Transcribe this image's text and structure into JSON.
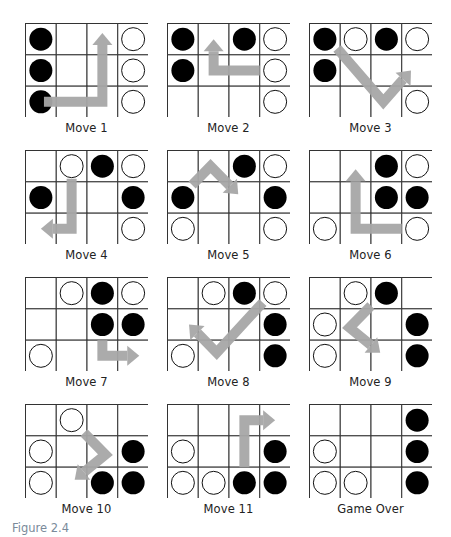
{
  "figure": {
    "label": "Figure 2.4",
    "grid": {
      "columns": 4,
      "rows": 3
    },
    "colors": {
      "black_piece": "#000000",
      "white_piece": "#ffffff",
      "arrow": "#a6a6a6",
      "grid_line": "#333333",
      "label": "#7a8a9a"
    }
  },
  "panels": [
    {
      "caption": "Move 1",
      "pieces": [
        {
          "r": 0,
          "c": 0,
          "p": "B"
        },
        {
          "r": 1,
          "c": 0,
          "p": "B"
        },
        {
          "r": 2,
          "c": 0,
          "p": "B"
        },
        {
          "r": 0,
          "c": 3,
          "p": "W"
        },
        {
          "r": 1,
          "c": 3,
          "p": "W"
        },
        {
          "r": 2,
          "c": 3,
          "p": "W"
        }
      ],
      "arrow": {
        "path": [
          [
            0.6,
            2.5
          ],
          [
            2.5,
            2.5
          ],
          [
            2.5,
            0.3
          ]
        ]
      }
    },
    {
      "caption": "Move 2",
      "pieces": [
        {
          "r": 0,
          "c": 0,
          "p": "B"
        },
        {
          "r": 0,
          "c": 2,
          "p": "B"
        },
        {
          "r": 1,
          "c": 0,
          "p": "B"
        },
        {
          "r": 0,
          "c": 3,
          "p": "W"
        },
        {
          "r": 1,
          "c": 3,
          "p": "W"
        },
        {
          "r": 2,
          "c": 3,
          "p": "W"
        }
      ],
      "arrow": {
        "path": [
          [
            3.0,
            1.5
          ],
          [
            1.5,
            1.5
          ],
          [
            1.5,
            0.5
          ]
        ]
      }
    },
    {
      "caption": "Move 3",
      "pieces": [
        {
          "r": 0,
          "c": 0,
          "p": "B"
        },
        {
          "r": 0,
          "c": 2,
          "p": "B"
        },
        {
          "r": 1,
          "c": 0,
          "p": "B"
        },
        {
          "r": 0,
          "c": 1,
          "p": "W"
        },
        {
          "r": 0,
          "c": 3,
          "p": "W"
        },
        {
          "r": 2,
          "c": 3,
          "p": "W"
        }
      ],
      "arrow": {
        "path": [
          [
            0.9,
            0.8
          ],
          [
            2.4,
            2.5
          ],
          [
            3.3,
            1.5
          ]
        ]
      }
    },
    {
      "caption": "Move 4",
      "pieces": [
        {
          "r": 0,
          "c": 2,
          "p": "B"
        },
        {
          "r": 1,
          "c": 0,
          "p": "B"
        },
        {
          "r": 1,
          "c": 3,
          "p": "B"
        },
        {
          "r": 0,
          "c": 1,
          "p": "W"
        },
        {
          "r": 0,
          "c": 3,
          "p": "W"
        },
        {
          "r": 2,
          "c": 3,
          "p": "W"
        }
      ],
      "arrow": {
        "path": [
          [
            1.5,
            0.9
          ],
          [
            1.5,
            2.5
          ],
          [
            0.5,
            2.5
          ]
        ]
      }
    },
    {
      "caption": "Move 5",
      "pieces": [
        {
          "r": 0,
          "c": 2,
          "p": "B"
        },
        {
          "r": 1,
          "c": 0,
          "p": "B"
        },
        {
          "r": 1,
          "c": 3,
          "p": "B"
        },
        {
          "r": 0,
          "c": 3,
          "p": "W"
        },
        {
          "r": 2,
          "c": 0,
          "p": "W"
        },
        {
          "r": 2,
          "c": 3,
          "p": "W"
        }
      ],
      "arrow": {
        "path": [
          [
            0.8,
            1.1
          ],
          [
            1.4,
            0.5
          ],
          [
            2.3,
            1.4
          ]
        ]
      }
    },
    {
      "caption": "Move 6",
      "pieces": [
        {
          "r": 0,
          "c": 2,
          "p": "B"
        },
        {
          "r": 1,
          "c": 2,
          "p": "B"
        },
        {
          "r": 1,
          "c": 3,
          "p": "B"
        },
        {
          "r": 0,
          "c": 3,
          "p": "W"
        },
        {
          "r": 2,
          "c": 0,
          "p": "W"
        },
        {
          "r": 2,
          "c": 3,
          "p": "W"
        }
      ],
      "arrow": {
        "path": [
          [
            3.0,
            2.5
          ],
          [
            1.5,
            2.5
          ],
          [
            1.5,
            0.6
          ]
        ]
      }
    },
    {
      "caption": "Move 7",
      "pieces": [
        {
          "r": 0,
          "c": 2,
          "p": "B"
        },
        {
          "r": 1,
          "c": 2,
          "p": "B"
        },
        {
          "r": 1,
          "c": 3,
          "p": "B"
        },
        {
          "r": 0,
          "c": 1,
          "p": "W"
        },
        {
          "r": 0,
          "c": 3,
          "p": "W"
        },
        {
          "r": 2,
          "c": 0,
          "p": "W"
        }
      ],
      "arrow": {
        "path": [
          [
            2.5,
            2.0
          ],
          [
            2.5,
            2.5
          ],
          [
            3.7,
            2.5
          ]
        ]
      }
    },
    {
      "caption": "Move 8",
      "pieces": [
        {
          "r": 0,
          "c": 2,
          "p": "B"
        },
        {
          "r": 1,
          "c": 3,
          "p": "B"
        },
        {
          "r": 2,
          "c": 3,
          "p": "B"
        },
        {
          "r": 0,
          "c": 1,
          "p": "W"
        },
        {
          "r": 0,
          "c": 3,
          "p": "W"
        },
        {
          "r": 2,
          "c": 0,
          "p": "W"
        }
      ],
      "arrow": {
        "path": [
          [
            3.1,
            0.8
          ],
          [
            1.6,
            2.4
          ],
          [
            0.7,
            1.5
          ]
        ]
      }
    },
    {
      "caption": "Move 9",
      "pieces": [
        {
          "r": 0,
          "c": 2,
          "p": "B"
        },
        {
          "r": 1,
          "c": 3,
          "p": "B"
        },
        {
          "r": 2,
          "c": 3,
          "p": "B"
        },
        {
          "r": 0,
          "c": 1,
          "p": "W"
        },
        {
          "r": 1,
          "c": 0,
          "p": "W"
        },
        {
          "r": 2,
          "c": 0,
          "p": "W"
        }
      ],
      "arrow": {
        "path": [
          [
            2.0,
            0.9
          ],
          [
            1.3,
            1.6
          ],
          [
            2.3,
            2.4
          ]
        ]
      }
    },
    {
      "caption": "Move 10",
      "pieces": [
        {
          "r": 1,
          "c": 3,
          "p": "B"
        },
        {
          "r": 2,
          "c": 2,
          "p": "B"
        },
        {
          "r": 2,
          "c": 3,
          "p": "B"
        },
        {
          "r": 0,
          "c": 1,
          "p": "W"
        },
        {
          "r": 1,
          "c": 0,
          "p": "W"
        },
        {
          "r": 2,
          "c": 0,
          "p": "W"
        }
      ],
      "arrow": {
        "path": [
          [
            1.9,
            0.9
          ],
          [
            2.6,
            1.6
          ],
          [
            1.6,
            2.4
          ]
        ]
      }
    },
    {
      "caption": "Move 11",
      "pieces": [
        {
          "r": 1,
          "c": 3,
          "p": "B"
        },
        {
          "r": 2,
          "c": 2,
          "p": "B"
        },
        {
          "r": 2,
          "c": 3,
          "p": "B"
        },
        {
          "r": 1,
          "c": 0,
          "p": "W"
        },
        {
          "r": 2,
          "c": 0,
          "p": "W"
        },
        {
          "r": 2,
          "c": 1,
          "p": "W"
        }
      ],
      "arrow": {
        "path": [
          [
            2.5,
            2.0
          ],
          [
            2.5,
            0.5
          ],
          [
            3.5,
            0.5
          ]
        ]
      }
    },
    {
      "caption": "Game Over",
      "pieces": [
        {
          "r": 0,
          "c": 3,
          "p": "B"
        },
        {
          "r": 1,
          "c": 3,
          "p": "B"
        },
        {
          "r": 2,
          "c": 3,
          "p": "B"
        },
        {
          "r": 1,
          "c": 0,
          "p": "W"
        },
        {
          "r": 2,
          "c": 0,
          "p": "W"
        },
        {
          "r": 2,
          "c": 1,
          "p": "W"
        }
      ],
      "arrow": null
    }
  ]
}
